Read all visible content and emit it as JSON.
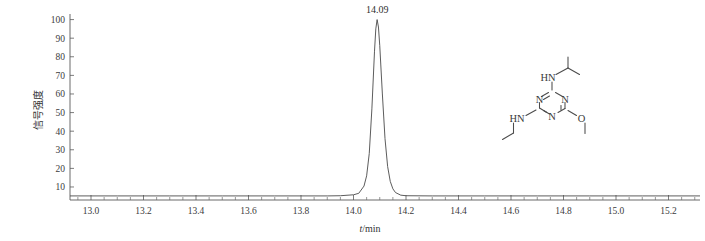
{
  "chart_data": {
    "type": "line",
    "title": "",
    "xlabel": "t/min",
    "ylabel": "信号强度",
    "xlim": [
      12.92,
      15.32
    ],
    "ylim": [
      3,
      103
    ],
    "grid": false,
    "legend": null,
    "x_ticks": [
      "13.0",
      "13.2",
      "13.4",
      "13.6",
      "13.8",
      "14.0",
      "14.2",
      "14.4",
      "14.6",
      "14.8",
      "15.0",
      "15.2"
    ],
    "x_tick_values": [
      13.0,
      13.2,
      13.4,
      13.6,
      13.8,
      14.0,
      14.2,
      14.4,
      14.6,
      14.8,
      15.0,
      15.2
    ],
    "x_minor_interval": 0.05,
    "y_ticks": [
      "10",
      "20",
      "30",
      "40",
      "50",
      "60",
      "70",
      "80",
      "90",
      "100"
    ],
    "y_tick_values": [
      10,
      20,
      30,
      40,
      50,
      60,
      70,
      80,
      90,
      100
    ],
    "baseline_value": 5.2,
    "annotations": [
      {
        "text": "14.09",
        "x": 14.09,
        "y": 100
      }
    ],
    "series": [
      {
        "name": "chromatogram",
        "color": "#4a4a4a",
        "peaks": [
          {
            "retention_time": 14.09,
            "height": 100,
            "half_width": 0.028,
            "label": "14.09"
          }
        ],
        "x": [
          12.92,
          13.0,
          13.1,
          13.2,
          13.3,
          13.4,
          13.5,
          13.6,
          13.7,
          13.8,
          13.9,
          13.95,
          14.0,
          14.02,
          14.04,
          14.05,
          14.06,
          14.07,
          14.08,
          14.085,
          14.09,
          14.095,
          14.1,
          14.11,
          14.12,
          14.13,
          14.14,
          14.15,
          14.16,
          14.18,
          14.2,
          14.3,
          14.4,
          14.5,
          14.6,
          14.7,
          14.8,
          14.9,
          15.0,
          15.1,
          15.2,
          15.32
        ],
        "y": [
          5.2,
          5.2,
          5.2,
          5.2,
          5.2,
          5.2,
          5.2,
          5.2,
          5.2,
          5.2,
          5.2,
          5.3,
          5.8,
          6.6,
          10.5,
          16.0,
          28.0,
          52.0,
          83.0,
          95.0,
          100.0,
          96.0,
          86.0,
          60.0,
          36.0,
          21.0,
          13.0,
          9.0,
          7.0,
          5.6,
          5.3,
          5.2,
          5.2,
          5.2,
          5.2,
          5.2,
          5.2,
          5.2,
          5.2,
          5.2,
          5.2,
          5.2
        ]
      }
    ]
  },
  "structure": {
    "name": "prometon-structure",
    "description": "1,3,5-triazine ring with isopropylamino, ethylamino and methoxy substituents",
    "atom_labels": [
      {
        "id": "n-ring-left",
        "text": "N"
      },
      {
        "id": "n-ring-right",
        "text": "N"
      },
      {
        "id": "n-ring-bottom",
        "text": "N"
      },
      {
        "id": "hn-top",
        "text": "HN"
      },
      {
        "id": "hn-left",
        "text": "HN"
      },
      {
        "id": "o-methoxy",
        "text": "O"
      }
    ]
  }
}
